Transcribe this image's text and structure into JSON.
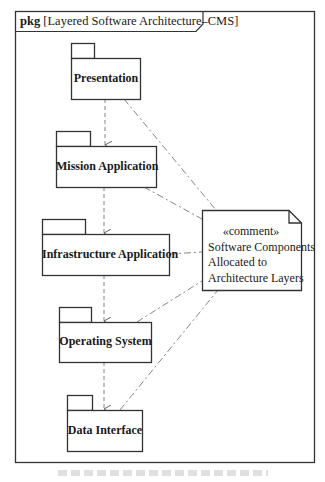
{
  "frame": {
    "keyword": "pkg",
    "title": "[Layered Software Architecture–CMS]"
  },
  "packages": [
    {
      "id": "presentation",
      "label": "Presentation"
    },
    {
      "id": "mission-application",
      "label": "Mission Application"
    },
    {
      "id": "infrastructure-application",
      "label": "Infrastructure Application"
    },
    {
      "id": "operating-system",
      "label": "Operating System"
    },
    {
      "id": "data-interface",
      "label": "Data Interface"
    }
  ],
  "dependencies": [
    {
      "from": "Presentation",
      "to": "Mission Application"
    },
    {
      "from": "Mission Application",
      "to": "Infrastructure Application"
    },
    {
      "from": "Infrastructure Application",
      "to": "Operating System"
    },
    {
      "from": "Operating System",
      "to": "Data Interface"
    }
  ],
  "comment": {
    "stereotype": "«comment»",
    "lines": [
      "Software Components",
      "Allocated  to",
      "Architecture Layers"
    ],
    "anchored_to": [
      "Presentation",
      "Mission Application",
      "Infrastructure Application",
      "Operating System",
      "Data Interface"
    ]
  },
  "colors": {
    "stroke": "#333333",
    "background": "#ffffff"
  }
}
